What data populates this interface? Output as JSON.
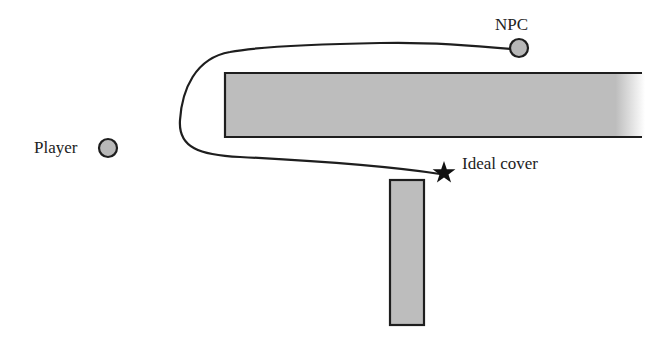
{
  "diagram": {
    "type": "top-down game AI cover path diagram",
    "labels": {
      "npc": "NPC",
      "player": "Player",
      "ideal_cover": "Ideal cover"
    },
    "colors": {
      "background": "#ffffff",
      "wall_fill": "#bdbdbd",
      "outline": "#1e1e1e",
      "circle_fill": "#b8b8b8",
      "text": "#222222"
    },
    "entities": {
      "npc": {
        "x": 519,
        "y": 48,
        "r": 9
      },
      "player": {
        "x": 108,
        "y": 148,
        "r": 9
      },
      "ideal_cover_star": {
        "x": 444,
        "y": 173
      }
    },
    "walls": [
      {
        "name": "horizontal-wall",
        "x": 225,
        "y": 73,
        "w": 446,
        "h": 64,
        "fades_right": true
      },
      {
        "name": "vertical-wall",
        "x": 390,
        "y": 180,
        "w": 34,
        "h": 145
      }
    ],
    "path": {
      "description": "NPC path looping around left end of horizontal wall to ideal cover"
    }
  }
}
